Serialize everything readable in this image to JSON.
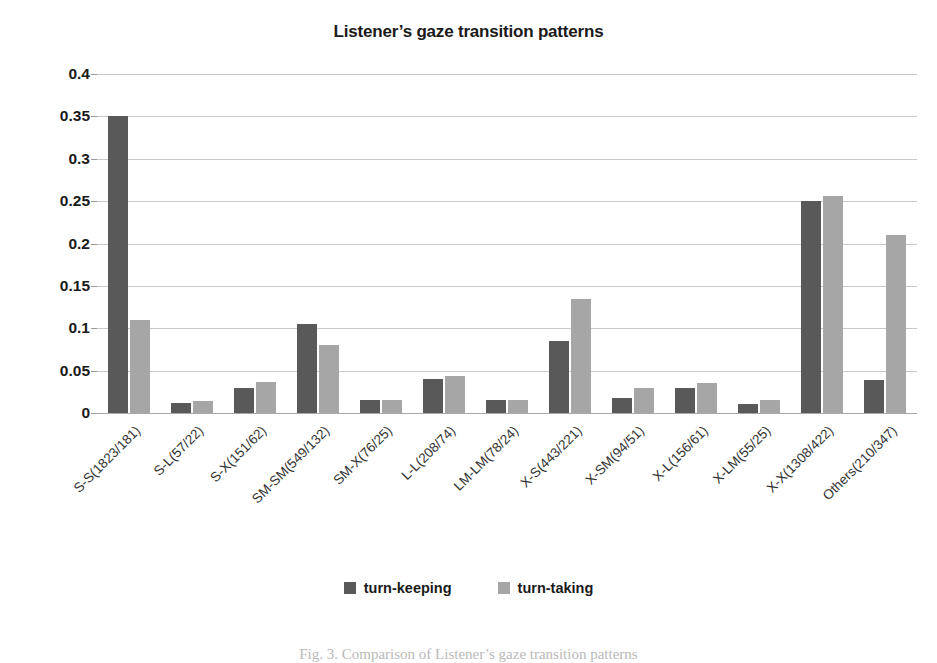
{
  "chart_data": {
    "type": "bar",
    "title": "Listener’s gaze transition patterns",
    "xlabel": "",
    "ylabel": "",
    "ylim": [
      0,
      0.4
    ],
    "ytick_labels": [
      "0.4",
      "0.35",
      "0.3",
      "0.25",
      "0.2",
      "0.15",
      "0.1",
      "0.05",
      "0"
    ],
    "ytick_values": [
      0.4,
      0.35,
      0.3,
      0.25,
      0.2,
      0.15,
      0.1,
      0.05,
      0
    ],
    "grid": true,
    "legend_position": "bottom",
    "categories": [
      "S-S(1823/181)",
      "S-L(57/22)",
      "S-X(151/62)",
      "SM-SM(549/132)",
      "SM-X(76/25)",
      "L-L(208/74)",
      "LM-LM(78/24)",
      "X-S(443/221)",
      "X-SM(94/51)",
      "X-L(156/61)",
      "X-LM(55/25)",
      "X-X(1308/422)",
      "Others(210/347)"
    ],
    "series": [
      {
        "name": "turn-keeping",
        "color": "#595959",
        "values": [
          0.35,
          0.012,
          0.029,
          0.105,
          0.015,
          0.04,
          0.015,
          0.085,
          0.018,
          0.029,
          0.011,
          0.25,
          0.039
        ]
      },
      {
        "name": "turn-taking",
        "color": "#a6a6a6",
        "values": [
          0.11,
          0.014,
          0.037,
          0.08,
          0.015,
          0.044,
          0.015,
          0.134,
          0.03,
          0.036,
          0.015,
          0.256,
          0.21
        ]
      }
    ]
  },
  "legend": {
    "items": [
      {
        "label": "turn-keeping",
        "color": "#595959"
      },
      {
        "label": "turn-taking",
        "color": "#a6a6a6"
      }
    ]
  },
  "caption": {
    "text": "Fig. 3. Comparison of Listener’s gaze transition patterns"
  }
}
